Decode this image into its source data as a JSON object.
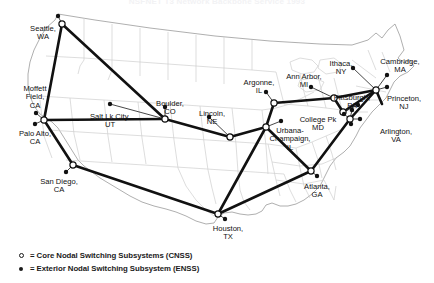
{
  "title": "NSFNET T3 Network Backbone Service 1993",
  "map": {
    "background_color": "#ffffff",
    "state_border_color": "#c9c9c9",
    "coast_border_color": "#9a9a9a",
    "backbone_link_color": "#111111",
    "access_link_color": "#333333",
    "node_fill_color": "#111111",
    "node_open_fill": "#ffffff"
  },
  "legend": {
    "items": [
      {
        "marker": "open-circle",
        "text": "= Core Nodal Switching Subsystems (CNSS)"
      },
      {
        "marker": "filled-dot",
        "text": "= Exterior Nodal Switching Subsystem (ENSS)"
      }
    ]
  },
  "cities": [
    {
      "name": "Seattle,\nWA",
      "label_x": 43,
      "label_y": 25,
      "align": "center"
    },
    {
      "name": "Moffett\nField,\nCA",
      "label_x": 35,
      "label_y": 85,
      "align": "center"
    },
    {
      "name": "Palo Alto,\nCA",
      "label_x": 35,
      "label_y": 130,
      "align": "center"
    },
    {
      "name": "San Diego,\nCA",
      "label_x": 59,
      "label_y": 178,
      "align": "center"
    },
    {
      "name": "Salt Lk City,\nUT",
      "label_x": 110,
      "label_y": 113,
      "align": "center"
    },
    {
      "name": "Boulder,\nCO",
      "label_x": 170,
      "label_y": 100,
      "align": "center"
    },
    {
      "name": "Lincoln,\nNE",
      "label_x": 212,
      "label_y": 110,
      "align": "center"
    },
    {
      "name": "Houston,\nTX",
      "label_x": 228,
      "label_y": 225,
      "align": "center"
    },
    {
      "name": "Urbana-\nChampaign,\nIL",
      "label_x": 290,
      "label_y": 127,
      "align": "center"
    },
    {
      "name": "Argonne,\nIL",
      "label_x": 259,
      "label_y": 79,
      "align": "center"
    },
    {
      "name": "Ann Arbor,\nMI",
      "label_x": 304,
      "label_y": 73,
      "align": "center"
    },
    {
      "name": "Ithaca,\nNY",
      "label_x": 341,
      "label_y": 60,
      "align": "center"
    },
    {
      "name": "Cambridge,\nMA",
      "label_x": 400,
      "label_y": 58,
      "align": "center"
    },
    {
      "name": "Pittsburgh,\nPA",
      "label_x": 352,
      "label_y": 94,
      "align": "center"
    },
    {
      "name": "Princeton,\nNJ",
      "label_x": 404,
      "label_y": 95,
      "align": "center"
    },
    {
      "name": "College Pk\nMD",
      "label_x": 318,
      "label_y": 116,
      "align": "center"
    },
    {
      "name": "Arlington,\nVA",
      "label_x": 396,
      "label_y": 128,
      "align": "center"
    },
    {
      "name": "Atlanta,\nGA",
      "label_x": 317,
      "label_y": 183,
      "align": "center"
    }
  ],
  "nodes": {
    "cnss": [
      {
        "id": "seattle",
        "x": 62,
        "y": 24
      },
      {
        "id": "bayarea",
        "x": 44,
        "y": 120
      },
      {
        "id": "sandiego",
        "x": 73,
        "y": 165
      },
      {
        "id": "boulder",
        "x": 165,
        "y": 119
      },
      {
        "id": "lincoln",
        "x": 230,
        "y": 137
      },
      {
        "id": "houston",
        "x": 218,
        "y": 214
      },
      {
        "id": "urbana",
        "x": 266,
        "y": 127
      },
      {
        "id": "argonne",
        "x": 274,
        "y": 103
      },
      {
        "id": "annarbor",
        "x": 334,
        "y": 98
      },
      {
        "id": "atlanta",
        "x": 311,
        "y": 171
      },
      {
        "id": "collegepk",
        "x": 350,
        "y": 119
      },
      {
        "id": "nynj",
        "x": 376,
        "y": 90
      },
      {
        "id": "pittsburgh",
        "x": 343,
        "y": 112
      }
    ],
    "enss": [
      {
        "id": "seattle-e",
        "x": 58,
        "y": 16
      },
      {
        "id": "moffett-e",
        "x": 36,
        "y": 113
      },
      {
        "id": "paloalto-e",
        "x": 35,
        "y": 124
      },
      {
        "id": "sandiego-e",
        "x": 66,
        "y": 172
      },
      {
        "id": "saltlake-e",
        "x": 110,
        "y": 104
      },
      {
        "id": "boulder-e",
        "x": 165,
        "y": 107
      },
      {
        "id": "lincoln-e",
        "x": 209,
        "y": 117
      },
      {
        "id": "houston-e",
        "x": 225,
        "y": 219
      },
      {
        "id": "urbana-e",
        "x": 281,
        "y": 121
      },
      {
        "id": "argonne-e",
        "x": 266,
        "y": 92
      },
      {
        "id": "annarbor-e",
        "x": 311,
        "y": 87
      },
      {
        "id": "ithaca-e",
        "x": 353,
        "y": 68
      },
      {
        "id": "cambridge-e",
        "x": 387,
        "y": 75
      },
      {
        "id": "princeton-e",
        "x": 387,
        "y": 87
      },
      {
        "id": "pittsburgh-e",
        "x": 358,
        "y": 105
      },
      {
        "id": "collegepk-e",
        "x": 344,
        "y": 114
      },
      {
        "id": "collegepk-e2",
        "x": 352,
        "y": 110
      },
      {
        "id": "arlington-e",
        "x": 351,
        "y": 124
      },
      {
        "id": "arlington-e2",
        "x": 360,
        "y": 119
      },
      {
        "id": "atlanta-e",
        "x": 317,
        "y": 176
      }
    ]
  }
}
